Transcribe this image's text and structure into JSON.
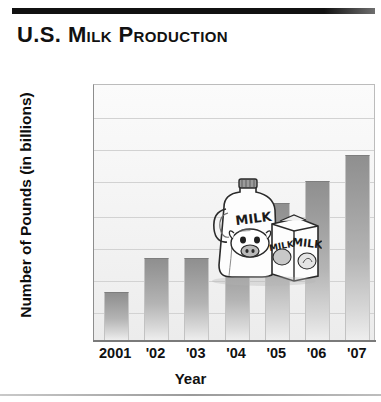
{
  "title": "U.S. Milk Production",
  "chart_data": {
    "type": "bar",
    "title": "U.S. Milk Production",
    "xlabel": "Year",
    "ylabel": "Number of Pounds (in billions)",
    "categories": [
      "2001",
      "'02",
      "'03",
      "'04",
      "'05",
      "'06",
      "'07"
    ],
    "values": [
      165.3,
      170.5,
      170.5,
      171.5,
      178.8,
      182.1,
      186.0
    ],
    "ylim": [
      160,
      195
    ],
    "yticks": [
      "195",
      "190",
      "185",
      "180",
      "175",
      "170",
      "165",
      "160",
      "0"
    ],
    "ytick_values": [
      195,
      190,
      185,
      180,
      175,
      170,
      165,
      160,
      0
    ],
    "grid": true,
    "legend": "none",
    "bar_color": "#9a9a9a",
    "plot_background": "#f3f3f3",
    "axis_color": "#7a7a7a"
  },
  "illustration": {
    "name": "milk-jug-and-carton-illustration",
    "jug_label": "MILK",
    "carton_label": "MILK",
    "carton_side_label": "MILK"
  },
  "decor": {
    "top_rule_color": "#111111",
    "bottom_rule_color": "#9a9a9a"
  }
}
